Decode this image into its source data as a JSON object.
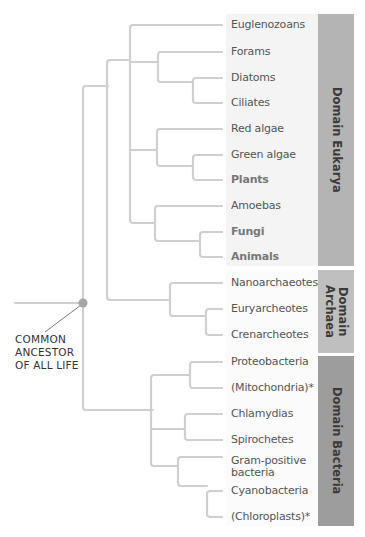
{
  "colors": {
    "branch": "#cfcfcf",
    "node": "#a6a6a6",
    "eukarya_band": "#b3b3b3",
    "archaea_band": "#bdbdbd",
    "bacteria_band": "#9e9e9e",
    "eukarya_label_bg": "#f3f3f3",
    "label_text": "#555555"
  },
  "root": {
    "label_lines": [
      "COMMON",
      "ANCESTOR",
      "OF ALL LIFE"
    ]
  },
  "domains": [
    {
      "name": "Domain Eukarya",
      "lines": [
        "Domain Eukarya"
      ],
      "leaves": [
        {
          "label": "Euglenozoans",
          "bold": false
        },
        {
          "label": "Forams",
          "bold": false
        },
        {
          "label": "Diatoms",
          "bold": false
        },
        {
          "label": "Ciliates",
          "bold": false
        },
        {
          "label": "Red algae",
          "bold": false
        },
        {
          "label": "Green algae",
          "bold": false
        },
        {
          "label": "Plants",
          "bold": true
        },
        {
          "label": "Amoebas",
          "bold": false
        },
        {
          "label": "Fungi",
          "bold": true
        },
        {
          "label": "Animals",
          "bold": true
        }
      ]
    },
    {
      "name": "Domain Archaea",
      "lines": [
        "Domain",
        "Archaea"
      ],
      "leaves": [
        {
          "label": "Nanoarchaeotes",
          "bold": false
        },
        {
          "label": "Euryarcheotes",
          "bold": false
        },
        {
          "label": "Crenarcheotes",
          "bold": false
        }
      ]
    },
    {
      "name": "Domain Bacteria",
      "lines": [
        "Domain Bacteria"
      ],
      "leaves": [
        {
          "label": "Proteobacteria",
          "bold": false
        },
        {
          "label": "(Mitochondria)*",
          "bold": false
        },
        {
          "label": "Chlamydias",
          "bold": false
        },
        {
          "label": "Spirochetes",
          "bold": false
        },
        {
          "label": "Gram-positive bacteria",
          "lines": [
            "Gram-positive",
            "bacteria"
          ],
          "bold": false
        },
        {
          "label": "Cyanobacteria",
          "bold": false
        },
        {
          "label": "(Chloroplasts)*",
          "bold": false
        }
      ]
    }
  ]
}
